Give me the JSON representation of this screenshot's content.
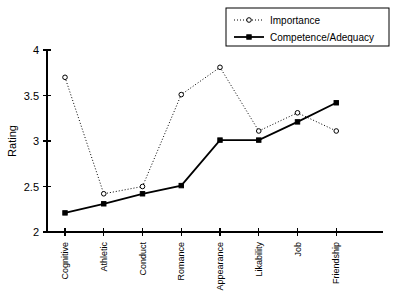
{
  "chart_data": {
    "type": "line",
    "title": "",
    "xlabel": "",
    "ylabel": "Rating",
    "ylim": [
      2,
      4
    ],
    "yticks": [
      "2",
      "2.5",
      "3",
      "3.5",
      "4"
    ],
    "ytick_values": [
      2,
      2.5,
      3,
      3.5,
      4
    ],
    "grid": false,
    "legend_position": "top-right",
    "categories": [
      "Cognitive",
      "Athletic",
      "Conduct",
      "Romance",
      "Appearance",
      "Likability",
      "Job",
      "Friendship"
    ],
    "series": [
      {
        "name": "Importance",
        "values": [
          3.7,
          2.42,
          2.5,
          3.51,
          3.81,
          3.11,
          3.31,
          3.11
        ],
        "style": "dotted",
        "marker": "open-circle",
        "color": "#000000"
      },
      {
        "name": "Competence/Adequacy",
        "values": [
          2.21,
          2.31,
          2.42,
          2.51,
          3.01,
          3.01,
          3.21,
          3.42
        ],
        "style": "solid",
        "marker": "filled-square",
        "color": "#000000"
      }
    ]
  },
  "legend": {
    "entries": [
      {
        "label": "Importance"
      },
      {
        "label": "Competence/Adequacy"
      }
    ]
  },
  "axes": {
    "y_axis_title": "Rating"
  },
  "colors": {
    "foreground": "#000000",
    "background": "#ffffff"
  }
}
